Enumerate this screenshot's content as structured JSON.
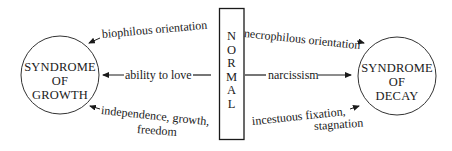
{
  "diagram": {
    "center_box": {
      "letters": [
        "N",
        "O",
        "R",
        "M",
        "A",
        "L"
      ],
      "word": "NORMAL"
    },
    "left_node": {
      "lines": [
        "SYNDROME",
        "OF",
        "GROWTH"
      ],
      "label": "SYNDROME OF GROWTH"
    },
    "right_node": {
      "lines": [
        "SYNDROME",
        "OF",
        "DECAY"
      ],
      "label": "SYNDROME OF DECAY"
    },
    "left_edges": [
      {
        "text": "biophilous orientation",
        "direction": "toward-growth"
      },
      {
        "text": "ability to love",
        "direction": "toward-growth"
      },
      {
        "line1": "independence, growth,",
        "line2": "freedom",
        "direction": "toward-growth"
      }
    ],
    "right_edges": [
      {
        "text": "necrophilous orientation",
        "direction": "toward-decay"
      },
      {
        "text": "narcissism",
        "direction": "toward-decay"
      },
      {
        "line1": "incestuous fixation,",
        "line2": "stagnation",
        "direction": "toward-decay"
      }
    ],
    "colors": {
      "ink": "#1a1a1a",
      "background": "#ffffff"
    }
  }
}
